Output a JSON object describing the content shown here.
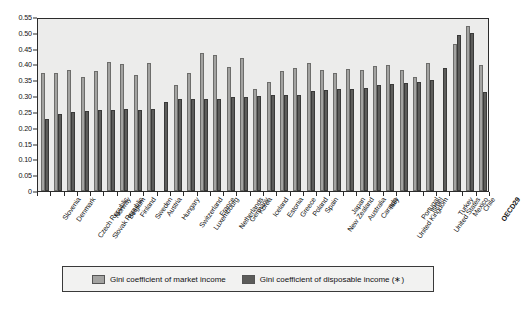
{
  "chart_data": {
    "type": "bar",
    "title": "",
    "xlabel": "",
    "ylabel": "",
    "ylim": [
      0,
      0.55
    ],
    "grid": false,
    "legend_position": "bottom",
    "ytick_labels": [
      "0.55",
      "0.50",
      "0.45",
      "0.40",
      "0.35",
      "0.30",
      "0.25",
      "0.20",
      "0.15",
      "0.10",
      "0.05",
      "0"
    ],
    "ytick_values": [
      0.55,
      0.5,
      0.45,
      0.4,
      0.35,
      0.3,
      0.25,
      0.2,
      0.15,
      0.1,
      0.05,
      0
    ],
    "categories": [
      "Slovenia",
      "Denmark",
      "Czech Republic",
      "Slovak Republic",
      "Norway",
      "Belgium",
      "Finland",
      "Sweden",
      "Austria",
      "Hungary",
      "Switzerland",
      "Luxembourg",
      "France",
      "Netherlands",
      "Germany",
      "Korea",
      "Iceland",
      "Estonia",
      "Greece",
      "Poland",
      "Spain",
      "New Zealand",
      "Japan",
      "Australia",
      "Canada",
      "Italy",
      "United Kingdom",
      "Portugal",
      "Israel",
      "United States",
      "Turkey",
      "Mexico",
      "Chile",
      "OECD29"
    ],
    "series": [
      {
        "name": "Gini coefficient of market income",
        "color": "#a3a3a1",
        "values": [
          0.372,
          0.374,
          0.381,
          0.361,
          0.378,
          0.408,
          0.403,
          0.368,
          0.405,
          null,
          0.335,
          0.372,
          0.436,
          0.43,
          0.391,
          0.419,
          0.322,
          0.345,
          0.379,
          0.39,
          0.404,
          0.382,
          0.374,
          0.387,
          0.381,
          0.395,
          0.398,
          0.382,
          0.36,
          0.404,
          null,
          0.466,
          0.522,
          0.397
        ]
      },
      {
        "name": "Gini coefficient of disposable income (∗)",
        "color": "#5c5c5a",
        "values": [
          0.228,
          0.244,
          0.251,
          0.254,
          0.256,
          0.256,
          0.258,
          0.256,
          0.26,
          0.28,
          0.29,
          0.29,
          0.292,
          0.291,
          0.297,
          0.298,
          0.3,
          0.302,
          0.303,
          0.305,
          0.317,
          0.318,
          0.321,
          0.324,
          0.326,
          0.334,
          0.339,
          0.341,
          0.345,
          0.35,
          0.39,
          0.493,
          0.5,
          0.312
        ]
      }
    ],
    "legend": [
      {
        "label": "Gini coefficient of market income",
        "color": "#a3a3a1"
      },
      {
        "label": "Gini coefficient of disposable income (∗)",
        "color": "#5c5c5a"
      }
    ]
  }
}
